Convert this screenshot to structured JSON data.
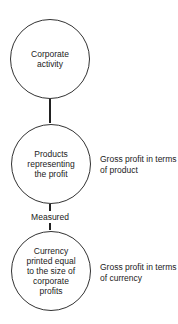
{
  "diagram": {
    "type": "vertical-flow",
    "nodes": [
      {
        "id": "corporate-activity",
        "label": "Corporate\nactivity",
        "shape": "circle",
        "side_label": ""
      },
      {
        "id": "products-representing-profit",
        "label": "Products\nrepresenting\nthe profit",
        "shape": "circle",
        "side_label": "Gross profit in terms\nof product"
      },
      {
        "id": "currency-printed",
        "label": "Currency\nprinted equal\nto the size of\ncorporate\nprofits",
        "shape": "circle",
        "side_label": "Gross profit in terms\nof currency"
      }
    ],
    "edges": [
      {
        "from": "corporate-activity",
        "to": "products-representing-profit",
        "label": ""
      },
      {
        "from": "products-representing-profit",
        "to": "currency-printed",
        "label": "Measured"
      }
    ],
    "colors": {
      "stroke": "#333333",
      "text": "#222222",
      "background": "#ffffff"
    }
  }
}
